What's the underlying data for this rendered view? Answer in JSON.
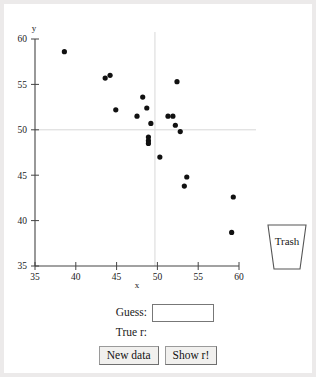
{
  "app": {
    "title": "Guess the Correlation"
  },
  "trash": {
    "label": "Trash",
    "icon": "trash-can-icon"
  },
  "controls": {
    "guess_label": "Guess:",
    "guess_value": "",
    "guess_placeholder": "",
    "true_r_label": "True r:",
    "true_r_value": "",
    "new_data_label": "New data",
    "show_r_label": "Show r!"
  },
  "colors": {
    "page_background": "#ffffff",
    "outer_background": "#eceaea",
    "axis": "#444444",
    "point": "#111111",
    "guide_line": "#d8d8d8",
    "button_face": "#f1f0ee",
    "button_border": "#9a9a9a"
  },
  "chart_data": {
    "type": "scatter",
    "title": "",
    "xlabel": "x",
    "ylabel": "y",
    "xlim": [
      35,
      60
    ],
    "ylim": [
      35,
      60
    ],
    "xticks": [
      35,
      40,
      45,
      50,
      55,
      60
    ],
    "yticks": [
      35,
      40,
      45,
      50,
      55,
      60
    ],
    "grid": false,
    "guides": {
      "vertical_x": 49.7,
      "horizontal_y": 50.0
    },
    "series": [
      {
        "name": "points",
        "marker": "filled-circle",
        "points": [
          {
            "x": 38.6,
            "y": 58.6
          },
          {
            "x": 43.6,
            "y": 55.7
          },
          {
            "x": 44.2,
            "y": 56.0
          },
          {
            "x": 52.4,
            "y": 55.3
          },
          {
            "x": 48.2,
            "y": 53.6
          },
          {
            "x": 44.9,
            "y": 52.2
          },
          {
            "x": 48.7,
            "y": 52.4
          },
          {
            "x": 47.5,
            "y": 51.5
          },
          {
            "x": 51.3,
            "y": 51.5
          },
          {
            "x": 51.9,
            "y": 51.5
          },
          {
            "x": 49.2,
            "y": 50.7
          },
          {
            "x": 52.2,
            "y": 50.5
          },
          {
            "x": 52.8,
            "y": 49.8
          },
          {
            "x": 48.9,
            "y": 49.2
          },
          {
            "x": 48.9,
            "y": 48.8
          },
          {
            "x": 48.9,
            "y": 48.5
          },
          {
            "x": 50.3,
            "y": 47.0
          },
          {
            "x": 53.6,
            "y": 44.8
          },
          {
            "x": 53.3,
            "y": 43.8
          },
          {
            "x": 59.3,
            "y": 42.6
          },
          {
            "x": 59.1,
            "y": 38.7
          }
        ]
      }
    ]
  }
}
